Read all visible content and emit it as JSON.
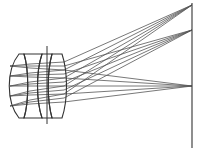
{
  "diagram": {
    "colors": {
      "lens": "#333333",
      "ray": "#555555",
      "image_plane": "#444444",
      "background": "#ffffff"
    },
    "image_plane": {
      "x": 192,
      "y1": 3,
      "y2": 148
    },
    "aperture_stop": {
      "x": 47,
      "y1": 46,
      "y2": 124
    },
    "lens_elements": [
      {
        "name": "element-1",
        "path": "M19 54 C6 70 6 102 19 118 L24 118 C29 102 29 70 24 54 Z"
      },
      {
        "name": "element-2",
        "path": "M24 54 L42 54 C36 72 36 100 42 118 L24 118 C29 102 29 70 24 54 Z"
      },
      {
        "name": "element-3",
        "path": "M42 54 L52 54 C47 72 47 100 52 118 L42 118 C36 100 36 72 42 54 Z"
      },
      {
        "name": "element-4",
        "path": "M52 54 L62 54 C68 72 68 100 62 118 L52 118 C47 100 47 72 52 54 Z"
      }
    ],
    "focus_points": [
      {
        "name": "focus-top",
        "x": 192,
        "y": 5
      },
      {
        "name": "focus-mid",
        "x": 192,
        "y": 30
      },
      {
        "name": "focus-axis",
        "x": 192,
        "y": 86
      }
    ],
    "ray_bundles": [
      {
        "target": 0,
        "start_ys": [
          62,
          70,
          78,
          86,
          94
        ]
      },
      {
        "target": 1,
        "start_ys": [
          66,
          74,
          82,
          90,
          98
        ]
      },
      {
        "target": 2,
        "start_ys": [
          70,
          78,
          86,
          94,
          102
        ]
      }
    ],
    "lens_exit_x": 64
  }
}
